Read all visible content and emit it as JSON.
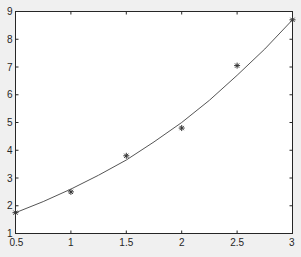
{
  "chart_data": {
    "type": "scatter",
    "title": "",
    "xlabel": "",
    "ylabel": "",
    "xlim": [
      0.5,
      3
    ],
    "ylim": [
      1,
      9
    ],
    "xticks": [
      0.5,
      1,
      1.5,
      2,
      2.5,
      3
    ],
    "xtick_labels": [
      "0.5",
      "1",
      "1.5",
      "2",
      "2.5",
      "3"
    ],
    "yticks": [
      1,
      2,
      3,
      4,
      5,
      6,
      7,
      8,
      9
    ],
    "ytick_labels": [
      "1",
      "2",
      "3",
      "4",
      "5",
      "6",
      "7",
      "8",
      "9"
    ],
    "grid": false,
    "series": [
      {
        "name": "data",
        "type": "scatter",
        "marker": "*",
        "x": [
          0.5,
          1,
          1.5,
          2,
          2.5,
          3
        ],
        "y": [
          1.75,
          2.5,
          3.8,
          4.8,
          7.05,
          8.7
        ]
      },
      {
        "name": "fit",
        "type": "line",
        "x": [
          0.5,
          0.75,
          1,
          1.25,
          1.5,
          1.75,
          2,
          2.25,
          2.5,
          2.75,
          3
        ],
        "y": [
          1.75,
          2.15,
          2.6,
          3.1,
          3.65,
          4.3,
          5.0,
          5.8,
          6.7,
          7.65,
          8.7
        ]
      }
    ],
    "colors": {
      "background": "#f0f0f0",
      "axes": "#ffffff",
      "line": "#555555",
      "marker": "#333333",
      "axis_line": "#262626"
    }
  }
}
